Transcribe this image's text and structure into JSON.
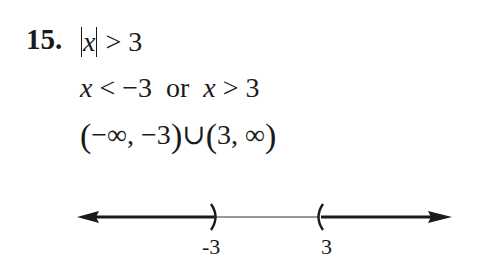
{
  "problem": {
    "number": "15.",
    "line1": {
      "var": "x",
      "rest": " > 3"
    },
    "line2": {
      "var1": "x",
      "part1": " < −3  or  ",
      "var2": "x",
      "part2": " > 3"
    },
    "line3": {
      "open1": "(",
      "content1": "−∞, −3",
      "close1": ")",
      "union": "∪",
      "open2": "(",
      "content2": "3, ∞",
      "close2": ")"
    }
  },
  "number_line": {
    "left_endpoint_label": "-3",
    "right_endpoint_label": "3",
    "left_endpoint_symbol": ")",
    "right_endpoint_symbol": "(",
    "left_shaded": "to −∞",
    "right_shaded": "to +∞",
    "line_color": "#1a1a1a"
  }
}
